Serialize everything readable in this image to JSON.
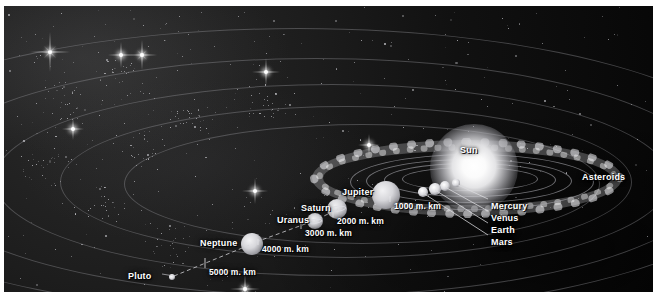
{
  "diagram": {
    "background_color": "#070707",
    "label_color": "#ffffff",
    "orbit_color": "#c4c4c8",
    "frame_color": "#ffffff"
  },
  "sun": {
    "label": "Sun",
    "x": 470,
    "y": 162,
    "radius": 17
  },
  "asteroid_belt": {
    "label": "Asteroids",
    "label_x": 583,
    "label_y": 172
  },
  "planets": [
    {
      "name": "Mercury",
      "label": "Mercury",
      "x": 452,
      "y": 177,
      "r": 2.0,
      "ring": false
    },
    {
      "name": "Venus",
      "label": "Venus",
      "x": 441,
      "y": 180,
      "r": 2.4,
      "ring": false
    },
    {
      "name": "Earth",
      "label": "Earth",
      "x": 431,
      "y": 183,
      "r": 2.6,
      "ring": false
    },
    {
      "name": "Mars",
      "label": "Mars",
      "x": 419,
      "y": 186,
      "r": 2.2,
      "ring": false
    },
    {
      "name": "Jupiter",
      "label": "Jupiter",
      "x": 382,
      "y": 189,
      "r": 6.5,
      "ring": false
    },
    {
      "name": "Saturn",
      "label": "Saturn",
      "x": 333,
      "y": 203,
      "r": 4.6,
      "ring": true
    },
    {
      "name": "Uranus",
      "label": "Uranus",
      "x": 311,
      "y": 215,
      "r": 3.6,
      "ring": true
    },
    {
      "name": "Neptune",
      "label": "Neptune",
      "x": 248,
      "y": 238,
      "r": 5.0,
      "ring": false
    },
    {
      "name": "Pluto",
      "label": "Pluto",
      "x": 168,
      "y": 271,
      "r": 1.4,
      "ring": false
    }
  ],
  "planet_labels": [
    {
      "text": "Mercury",
      "x": 487,
      "y": 196
    },
    {
      "text": "Venus",
      "x": 487,
      "y": 208
    },
    {
      "text": "Earth",
      "x": 487,
      "y": 220
    },
    {
      "text": "Mars",
      "x": 487,
      "y": 232
    },
    {
      "text": "Jupiter",
      "x": 338,
      "y": 182
    },
    {
      "text": "Saturn",
      "x": 297,
      "y": 198
    },
    {
      "text": "Uranus",
      "x": 273,
      "y": 210
    },
    {
      "text": "Neptune",
      "x": 196,
      "y": 233
    },
    {
      "text": "Pluto",
      "x": 124,
      "y": 266
    }
  ],
  "scale_markers": [
    {
      "text": "1000 m. km",
      "x": 390,
      "y": 196
    },
    {
      "text": "2000 m. km",
      "x": 333,
      "y": 211
    },
    {
      "text": "3000 m. km",
      "x": 301,
      "y": 223
    },
    {
      "text": "4000 m. km",
      "x": 258,
      "y": 239
    },
    {
      "text": "5000 m. km",
      "x": 205,
      "y": 262
    }
  ]
}
